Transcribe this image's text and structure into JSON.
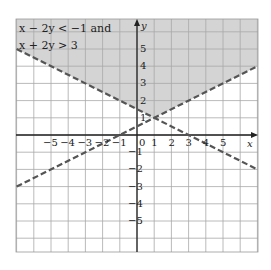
{
  "chart_data": {
    "type": "line",
    "title": "x − 2y < −1 and x + 2y > 3",
    "title_lines": [
      "x − 2y < −1 and",
      "x + 2y > 3"
    ],
    "xlabel": "x",
    "ylabel": "y",
    "xlim": [
      -7,
      7
    ],
    "ylim": [
      -7,
      7
    ],
    "grid": true,
    "x_ticks": [
      -5,
      -4,
      -3,
      -2,
      -1,
      0,
      1,
      2,
      3,
      4,
      5
    ],
    "y_ticks": [
      5,
      4,
      3,
      2,
      1,
      -1,
      -2,
      -3,
      -4,
      -5
    ],
    "series": [
      {
        "name": "x − 2y = −1",
        "style": "dashed",
        "x": [
          -7,
          7
        ],
        "y": [
          -3,
          4
        ]
      },
      {
        "name": "x + 2y = 3",
        "style": "dashed",
        "x": [
          -7,
          7
        ],
        "y": [
          5,
          -2
        ]
      }
    ],
    "intersection": {
      "x": 1,
      "y": 1
    },
    "shaded_region": "above both lines (y > (x+1)/2 and y > (3−x)/2)",
    "colors": {
      "shade": "#d4d4d4",
      "line": "#555555",
      "grid": "#aaaaaa"
    }
  },
  "labels": {
    "title_line1": "x − 2y < −1 and",
    "title_line2": "x + 2y > 3",
    "x_axis": "x",
    "y_axis": "y"
  }
}
